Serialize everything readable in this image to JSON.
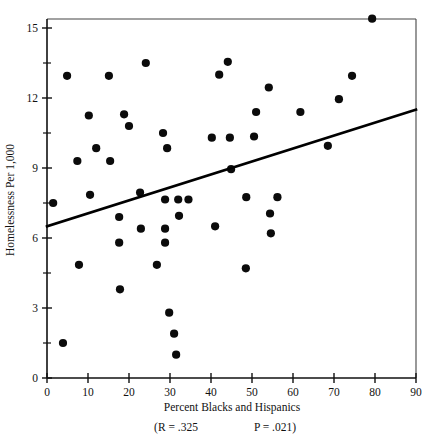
{
  "chart_data": {
    "type": "scatter",
    "title": "",
    "xlabel": "Percent Blacks and Hispanics",
    "ylabel": "Homelessness Per 1,000",
    "xlim": [
      0,
      90
    ],
    "ylim": [
      0,
      16.2
    ],
    "grid": false,
    "legend": null,
    "x_ticks": [
      0,
      10,
      20,
      30,
      40,
      50,
      60,
      70,
      80,
      90
    ],
    "x_tick_labels": [
      "0",
      "10",
      "20",
      "30",
      "40",
      "50",
      "60",
      "70",
      "80",
      "90"
    ],
    "y_ticks": [
      0,
      3,
      6,
      9,
      12,
      15
    ],
    "y_tick_labels": [
      "0",
      "3",
      "6",
      "9",
      "12",
      "15"
    ],
    "y_minor_ticks": [
      1.5,
      4.5,
      7.5,
      10.5,
      13.5,
      16
    ],
    "annotations": {
      "r_label": "(R = .325",
      "p_label": "P = .021)",
      "r_value": 0.325,
      "p_value": 0.021
    },
    "trendline": {
      "type": "linear",
      "x_start": 0,
      "y_start": 6.5,
      "x_end": 90,
      "y_end": 11.5
    },
    "points": [
      {
        "x": 1.5,
        "y": 7.5
      },
      {
        "x": 3.9,
        "y": 1.5
      },
      {
        "x": 4.9,
        "y": 12.95
      },
      {
        "x": 7.4,
        "y": 9.3
      },
      {
        "x": 7.8,
        "y": 4.85
      },
      {
        "x": 10.2,
        "y": 11.25
      },
      {
        "x": 10.5,
        "y": 7.85
      },
      {
        "x": 12.0,
        "y": 9.85
      },
      {
        "x": 15.1,
        "y": 12.95
      },
      {
        "x": 15.4,
        "y": 9.3
      },
      {
        "x": 17.6,
        "y": 6.9
      },
      {
        "x": 17.6,
        "y": 5.8
      },
      {
        "x": 17.8,
        "y": 3.8
      },
      {
        "x": 18.8,
        "y": 11.3
      },
      {
        "x": 20.0,
        "y": 10.8
      },
      {
        "x": 22.7,
        "y": 7.95
      },
      {
        "x": 22.9,
        "y": 6.4
      },
      {
        "x": 24.1,
        "y": 13.5
      },
      {
        "x": 26.8,
        "y": 4.85
      },
      {
        "x": 28.3,
        "y": 10.5
      },
      {
        "x": 28.8,
        "y": 7.65
      },
      {
        "x": 28.8,
        "y": 6.4
      },
      {
        "x": 28.8,
        "y": 5.8
      },
      {
        "x": 29.3,
        "y": 9.85
      },
      {
        "x": 29.8,
        "y": 2.8
      },
      {
        "x": 31.0,
        "y": 1.9
      },
      {
        "x": 31.5,
        "y": 1.0
      },
      {
        "x": 32.0,
        "y": 7.65
      },
      {
        "x": 32.2,
        "y": 6.95
      },
      {
        "x": 34.5,
        "y": 7.65
      },
      {
        "x": 40.2,
        "y": 10.3
      },
      {
        "x": 41.0,
        "y": 6.5
      },
      {
        "x": 42.0,
        "y": 13.0
      },
      {
        "x": 44.1,
        "y": 13.55
      },
      {
        "x": 44.6,
        "y": 10.3
      },
      {
        "x": 44.9,
        "y": 8.95
      },
      {
        "x": 48.5,
        "y": 4.7
      },
      {
        "x": 48.6,
        "y": 7.75
      },
      {
        "x": 50.5,
        "y": 10.35
      },
      {
        "x": 51.0,
        "y": 11.4
      },
      {
        "x": 54.1,
        "y": 12.45
      },
      {
        "x": 54.4,
        "y": 7.05
      },
      {
        "x": 54.6,
        "y": 6.2
      },
      {
        "x": 56.2,
        "y": 7.75
      },
      {
        "x": 61.8,
        "y": 11.4
      },
      {
        "x": 68.5,
        "y": 9.95
      },
      {
        "x": 71.2,
        "y": 11.95
      },
      {
        "x": 74.4,
        "y": 12.95
      },
      {
        "x": 79.3,
        "y": 15.4
      }
    ]
  }
}
